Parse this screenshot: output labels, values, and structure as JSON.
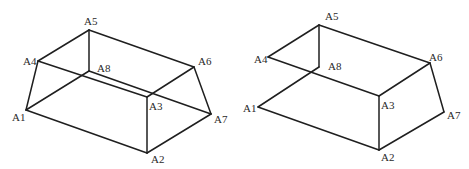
{
  "figures": [
    {
      "id": "left",
      "vertices": {
        "A1": {
          "x": 26,
          "y": 110
        },
        "A2": {
          "x": 147,
          "y": 153
        },
        "A3": {
          "x": 147,
          "y": 97
        },
        "A4": {
          "x": 38,
          "y": 61
        },
        "A5": {
          "x": 89,
          "y": 30
        },
        "A6": {
          "x": 194,
          "y": 67
        },
        "A7": {
          "x": 211,
          "y": 114
        },
        "A8": {
          "x": 89,
          "y": 71
        }
      },
      "edges": [
        [
          "A1",
          "A4"
        ],
        [
          "A4",
          "A5"
        ],
        [
          "A5",
          "A6"
        ],
        [
          "A6",
          "A7"
        ],
        [
          "A7",
          "A2"
        ],
        [
          "A2",
          "A1"
        ],
        [
          "A1",
          "A8"
        ],
        [
          "A8",
          "A5"
        ],
        [
          "A8",
          "A7"
        ],
        [
          "A4",
          "A3"
        ],
        [
          "A3",
          "A6"
        ],
        [
          "A3",
          "A2"
        ]
      ],
      "labels": [
        {
          "text": "A5",
          "x": 84,
          "y": 25
        },
        {
          "text": "A4",
          "x": 23,
          "y": 65
        },
        {
          "text": "A8",
          "x": 97,
          "y": 72
        },
        {
          "text": "A6",
          "x": 198,
          "y": 65
        },
        {
          "text": "A3",
          "x": 149,
          "y": 110
        },
        {
          "text": "A1",
          "x": 12,
          "y": 121
        },
        {
          "text": "A7",
          "x": 214,
          "y": 123
        },
        {
          "text": "A2",
          "x": 151,
          "y": 163
        }
      ]
    },
    {
      "id": "right",
      "vertices": {
        "A1": {
          "x": 258,
          "y": 107
        },
        "A2": {
          "x": 379,
          "y": 150
        },
        "A3": {
          "x": 379,
          "y": 96
        },
        "A4": {
          "x": 268,
          "y": 57
        },
        "A5": {
          "x": 319,
          "y": 25
        },
        "A6": {
          "x": 430,
          "y": 63
        },
        "A7": {
          "x": 444,
          "y": 112
        },
        "A8": {
          "x": 319,
          "y": 67
        }
      },
      "edges": [
        [
          "A4",
          "A5"
        ],
        [
          "A5",
          "A6"
        ],
        [
          "A6",
          "A3"
        ],
        [
          "A3",
          "A4"
        ],
        [
          "A5",
          "A8"
        ],
        [
          "A8",
          "A1"
        ],
        [
          "A1",
          "A2"
        ],
        [
          "A2",
          "A3"
        ],
        [
          "A2",
          "A7"
        ],
        [
          "A7",
          "A6"
        ]
      ],
      "labels": [
        {
          "text": "A5",
          "x": 325,
          "y": 20
        },
        {
          "text": "A4",
          "x": 254,
          "y": 63
        },
        {
          "text": "A8",
          "x": 328,
          "y": 70
        },
        {
          "text": "A6",
          "x": 429,
          "y": 61
        },
        {
          "text": "A3",
          "x": 381,
          "y": 109
        },
        {
          "text": "A1",
          "x": 243,
          "y": 112
        },
        {
          "text": "A7",
          "x": 447,
          "y": 119
        },
        {
          "text": "A2",
          "x": 381,
          "y": 161
        }
      ]
    }
  ]
}
